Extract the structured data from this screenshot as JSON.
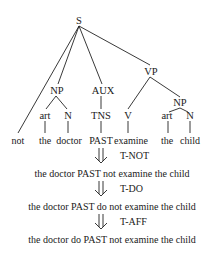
{
  "tree": {
    "root": "S",
    "nodes": {
      "S": "S",
      "VP": "VP",
      "NP_subj": "NP",
      "AUX": "AUX",
      "NP_obj": "NP",
      "art_subj": "art",
      "N_subj": "N",
      "TNS": "TNS",
      "V": "V",
      "art_obj": "art",
      "N_obj": "N"
    },
    "leaves": [
      "not",
      "the",
      "doctor",
      "PAST",
      "examine",
      "the",
      "child"
    ]
  },
  "derivation": [
    {
      "rule": "T-NOT",
      "result": "the doctor PAST not examine the child"
    },
    {
      "rule": "T-DO",
      "result": "the doctor PAST do not examine the child"
    },
    {
      "rule": "T-AFF",
      "result": "the doctor do PAST not examine the child"
    }
  ],
  "icons": {
    "derivation_arrow": "double-down-arrow-icon"
  }
}
